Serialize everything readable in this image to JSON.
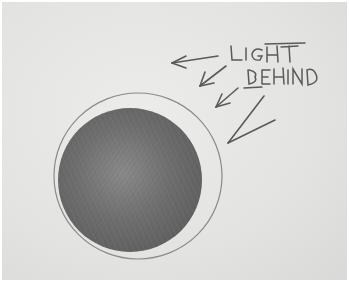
{
  "image": {
    "description": "Pencil sketch of a shaded sphere with light coming from behind",
    "annotation_text": [
      "LIGHT",
      "BEHIND"
    ],
    "arrow_count": 4,
    "colors": {
      "paper": "#e6e6e4",
      "pencil_dark": "#5a5a5a",
      "pencil_mid": "#7a7a7a",
      "outline": "#8a8a8a"
    }
  }
}
